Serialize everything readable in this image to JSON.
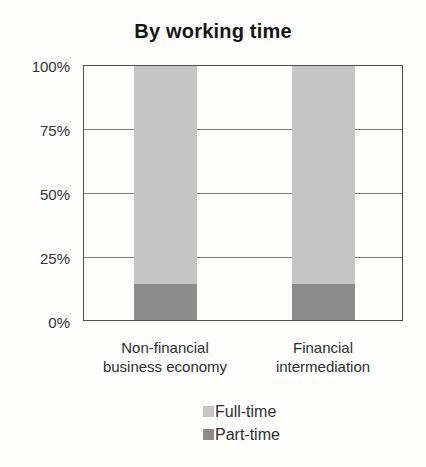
{
  "chart": {
    "y_ticks": [
      "100%",
      "75%",
      "50%",
      "25%",
      "0%"
    ]
  },
  "chart_data": {
    "type": "bar",
    "stacked": true,
    "title": "By working time",
    "categories": [
      "Non-financial business economy",
      "Financial intermediation"
    ],
    "series": [
      {
        "name": "Full-time",
        "values": [
          86,
          86
        ],
        "color": "#c5c5c5"
      },
      {
        "name": "Part-time",
        "values": [
          14,
          14
        ],
        "color": "#8c8c8c"
      }
    ],
    "xlabel": "",
    "ylabel": "",
    "ylim": [
      0,
      100
    ],
    "grid": true,
    "gridline_interval": 25,
    "legend_position": "bottom-center"
  }
}
